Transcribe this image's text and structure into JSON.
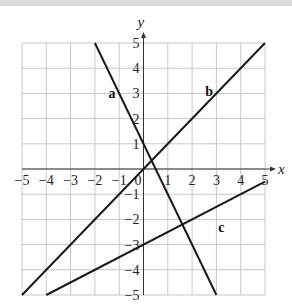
{
  "chart_data": {
    "type": "line",
    "title": "",
    "xlabel": "x",
    "ylabel": "y",
    "xlim": [
      -5,
      5
    ],
    "ylim": [
      -5,
      5
    ],
    "grid": true,
    "x_ticks": [
      -5,
      -4,
      -3,
      -2,
      -1,
      0,
      1,
      2,
      3,
      4,
      5
    ],
    "y_ticks": [
      -5,
      -4,
      -3,
      -2,
      -1,
      1,
      2,
      3,
      4,
      5
    ],
    "series": [
      {
        "name": "a",
        "equation": "y = -2x + 1",
        "points": [
          [
            -2,
            5
          ],
          [
            3,
            -5
          ]
        ],
        "label_pos": [
          -1.3,
          3
        ]
      },
      {
        "name": "b",
        "equation": "y = x",
        "points": [
          [
            -5,
            -5
          ],
          [
            5,
            5
          ]
        ],
        "label_pos": [
          2.7,
          3.1
        ]
      },
      {
        "name": "c",
        "equation": "y = 0.5x - 3",
        "points": [
          [
            -4,
            -5
          ],
          [
            5,
            -0.5
          ]
        ],
        "label_pos": [
          3.2,
          -2.3
        ]
      }
    ],
    "colors": {
      "line": "#1a1a1a",
      "grid": "#c8c8c8",
      "axis": "#333333"
    }
  }
}
